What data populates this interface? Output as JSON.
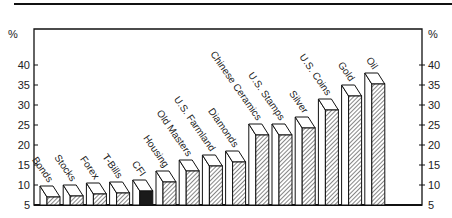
{
  "chart_data": {
    "type": "bar",
    "style": "3d-bar",
    "title": "",
    "xlabel": "",
    "ylabel": "%",
    "ylabel_right": "%",
    "ylim": [
      5,
      45
    ],
    "yticks": [
      5,
      10,
      15,
      20,
      25,
      30,
      35,
      40
    ],
    "grid": false,
    "legend": null,
    "categories": [
      "Bonds",
      "Stocks",
      "Forex",
      "T-Bills",
      "CFI",
      "Housing",
      "Old Masters",
      "U.S. Farmland",
      "Diamonds",
      "Chinese Ceramics",
      "U.S. Stamps",
      "Silver",
      "U.S. Coins",
      "Gold",
      "Oil"
    ],
    "values": [
      7,
      7.25,
      7.75,
      8,
      8.5,
      10.75,
      13.5,
      14.75,
      15.75,
      22.5,
      22.5,
      24.25,
      28.75,
      32.25,
      35.25
    ],
    "highlight_index": 4,
    "colors": {
      "bar_fill": "hatched",
      "highlight_fill": "#1a1a1a",
      "outline": "#111111"
    }
  }
}
